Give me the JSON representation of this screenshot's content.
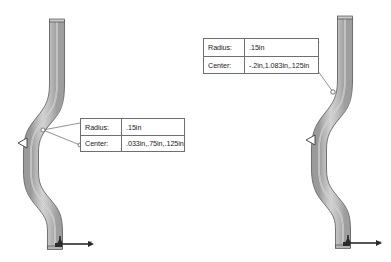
{
  "scene": {
    "background_color": "#ffffff",
    "view_count": 2,
    "description": "CAD S-bend pipe geometry, two views with radius/center annotation callouts"
  },
  "colors": {
    "pipe_fill_light": "#d8d8d8",
    "pipe_fill_mid": "#b9b9b9",
    "pipe_fill_dark": "#8e8e8e",
    "pipe_outline": "#4a4a4a",
    "callout_border": "#6f6f6f",
    "leader_line": "#777777",
    "text": "#1b1b1b",
    "axis": "#2b2b2b"
  },
  "views": [
    {
      "name": "left-view",
      "callout": {
        "rows": [
          {
            "label": "Radius:",
            "value": ".15in"
          },
          {
            "label": "Center:",
            "value": ".033in,.75in,.125in"
          }
        ]
      },
      "axis": {
        "x_label": "x"
      },
      "marker": "bend-vertex-triangle"
    },
    {
      "name": "right-view",
      "callout": {
        "rows": [
          {
            "label": "Radius:",
            "value": ".15in"
          },
          {
            "label": "Center:",
            "value": "-.2in,1.083in,.125in"
          }
        ]
      },
      "axis": {
        "x_label": "x"
      },
      "marker": "bend-vertex-triangle"
    }
  ]
}
